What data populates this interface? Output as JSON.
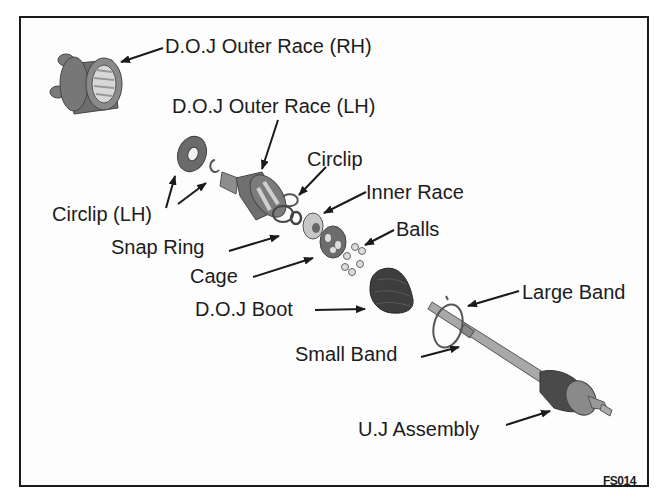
{
  "figure": {
    "code": "FS014",
    "colors": {
      "frame": "#1a1a1a",
      "text": "#1c1c1c",
      "part_dark": "#555555",
      "part_mid": "#8a8a8a",
      "part_light": "#c8c8c8"
    }
  },
  "labels": {
    "doj_outer_race_rh": "D.O.J Outer Race (RH)",
    "doj_outer_race_lh": "D.O.J Outer Race (LH)",
    "circlip": "Circlip",
    "inner_race": "Inner Race",
    "balls": "Balls",
    "circlip_lh": "Circlip (LH)",
    "snap_ring": "Snap Ring",
    "cage": "Cage",
    "doj_boot": "D.O.J Boot",
    "small_band": "Small Band",
    "large_band": "Large Band",
    "uj_assembly": "U.J Assembly"
  }
}
